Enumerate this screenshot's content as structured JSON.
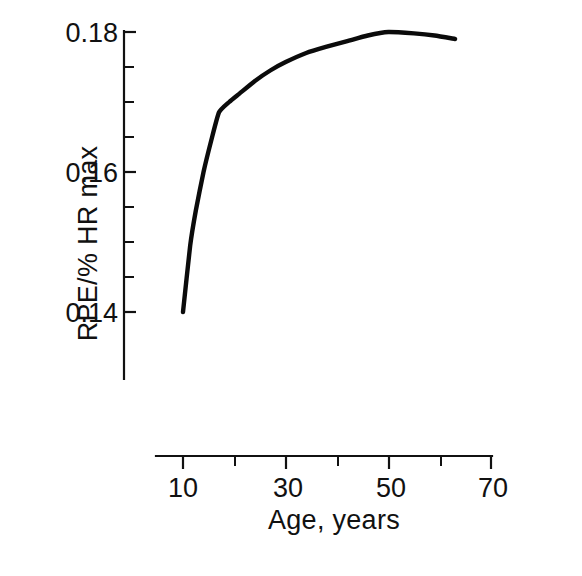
{
  "chart_data": {
    "type": "line",
    "title": "",
    "xlabel": "Age,  years",
    "ylabel": "RPE/% HR max",
    "xlim": [
      7,
      70
    ],
    "ylim": [
      0.1295,
      0.1825
    ],
    "grid": false,
    "legend": "none",
    "x_ticks": [
      10,
      20,
      30,
      40,
      50,
      60,
      70
    ],
    "x_tick_labels": [
      "10",
      "",
      "30",
      "",
      "50",
      "",
      "70"
    ],
    "x_tick_labels_shown": [
      "10",
      "30",
      "50",
      "70"
    ],
    "y_ticks": [
      0.14,
      0.145,
      0.15,
      0.155,
      0.16,
      0.165,
      0.17,
      0.175,
      0.18
    ],
    "y_tick_labels": [
      "0.14",
      "",
      "",
      "",
      "0.16",
      "",
      "",
      "",
      "0.18"
    ],
    "y_tick_labels_shown": [
      "0.14",
      "0.16",
      "0.18"
    ],
    "series": [
      {
        "name": "RPE/% HR max vs Age",
        "color": "#0b0b0b",
        "x": [
          10.0,
          11.4,
          12.5,
          14.0,
          15.5,
          17.0,
          19.0,
          21.0,
          24.0,
          27.0,
          30.0,
          34.0,
          38.0,
          42.0,
          46.0,
          50.0,
          55.0,
          59.0,
          63.0
        ],
        "y": [
          0.14,
          0.1495,
          0.1545,
          0.16,
          0.1645,
          0.1685,
          0.17,
          0.1712,
          0.173,
          0.1745,
          0.1757,
          0.177,
          0.1779,
          0.1787,
          0.1795,
          0.18,
          0.1798,
          0.1795,
          0.179
        ]
      }
    ],
    "notes": {
      "axis_style": "detached L-frame: y-axis bar at left, x-axis bar below plot, offset",
      "x_axis_range_drawn": [
        7.5,
        70
      ],
      "y_axis_range_drawn": [
        0.1295,
        0.1805
      ]
    }
  },
  "figure": {
    "background": "#ffffff",
    "line_color": "#0b0b0b",
    "axis_color": "#111111"
  }
}
